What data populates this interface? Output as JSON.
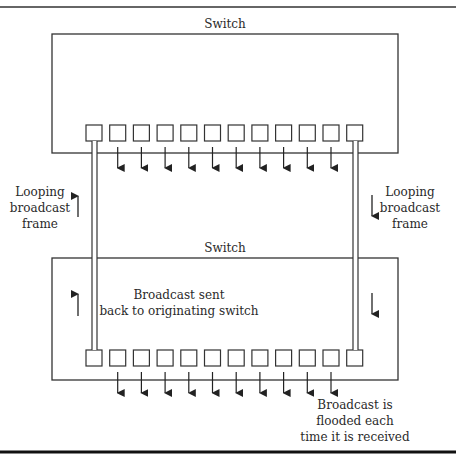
{
  "diagram": {
    "top_switch": {
      "label": "Switch",
      "port_count": 12
    },
    "bottom_switch": {
      "label": "Switch",
      "port_count": 12
    },
    "left_annotation": [
      "Looping",
      "broadcast",
      "frame"
    ],
    "right_annotation": [
      "Looping",
      "broadcast",
      "frame"
    ],
    "middle_annotation": [
      "Broadcast sent",
      "back to originating switch"
    ],
    "bottom_annotation": [
      "Broadcast is",
      "flooded each",
      "time it is received"
    ],
    "flood_arrow_ports": [
      2,
      3,
      4,
      5,
      6,
      7,
      8,
      9,
      10,
      11
    ],
    "colors": {
      "line": "#333333",
      "background": "#ffffff"
    }
  }
}
